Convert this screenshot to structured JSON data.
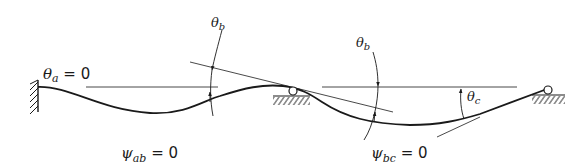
{
  "diagram": {
    "type": "continuous-beam-deflection",
    "colors": {
      "ink": "#1a1a1a",
      "background": "#ffffff"
    },
    "supports": [
      {
        "id": "a",
        "kind": "fixed-wall"
      },
      {
        "id": "b",
        "kind": "roller"
      },
      {
        "id": "c",
        "kind": "roller"
      }
    ],
    "labels": {
      "theta_a": {
        "symbol": "θ",
        "sub": "a",
        "eq": " = 0"
      },
      "theta_b_left": {
        "symbol": "θ",
        "sub": "b"
      },
      "theta_b_right": {
        "symbol": "θ",
        "sub": "b"
      },
      "theta_c": {
        "symbol": "θ",
        "sub": "c"
      },
      "psi_ab": {
        "symbol": "ψ",
        "sub": "ab",
        "eq": " = 0"
      },
      "psi_bc": {
        "symbol": "ψ",
        "sub": "bc",
        "eq": " = 0"
      }
    }
  }
}
